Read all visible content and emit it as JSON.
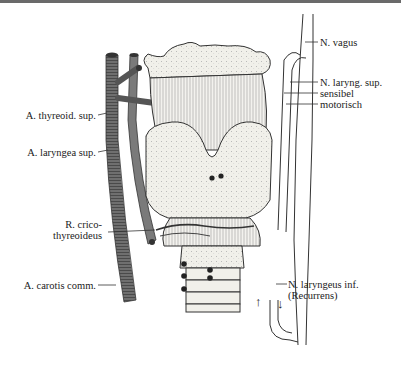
{
  "figure": {
    "labels": {
      "n_vagus": "N. vagus",
      "n_laryng_sup": "N. laryng. sup.",
      "sensibel": "sensibel",
      "motorisch": "motorisch",
      "a_thyreoid_sup": "A. thyreoid. sup.",
      "a_laryngea_sup": "A. laryngea sup.",
      "r_crico_1": "R. crico-",
      "r_crico_2": "thyreoideus",
      "a_carotis_comm": "A. carotis comm.",
      "n_laryngeus_inf_1": "N. laryngeus inf.",
      "n_laryngeus_inf_2": "(Recurrens)"
    },
    "arrows": {
      "up": "↑",
      "down": "↓"
    },
    "colors": {
      "artery": "#6f6f6f",
      "cartilage": "#f1f0ea",
      "outline": "#333333",
      "nerve": "#ffffff"
    }
  }
}
